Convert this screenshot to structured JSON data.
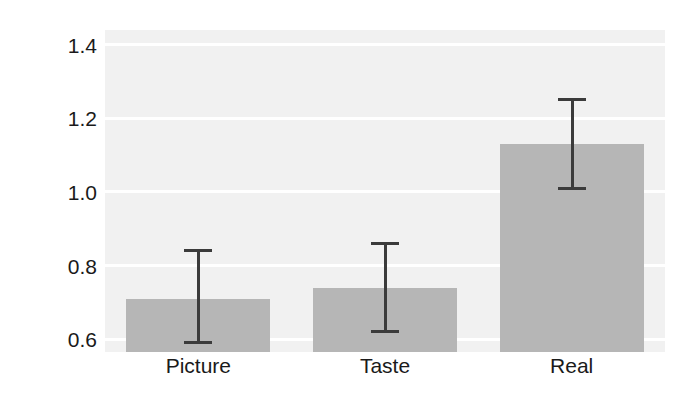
{
  "chart_data": {
    "type": "bar",
    "title": "",
    "xlabel": "",
    "ylabel": "Bid ( $ )",
    "categories": [
      "Picture",
      "Taste",
      "Real"
    ],
    "values": [
      0.71,
      0.74,
      1.13
    ],
    "error_low": [
      0.59,
      0.62,
      1.01
    ],
    "error_high": [
      0.84,
      0.86,
      1.25
    ],
    "ylim": [
      0.565,
      1.44
    ],
    "yticks": [
      0.6,
      0.8,
      1.0,
      1.2,
      1.4
    ],
    "ytick_labels": [
      "0.6",
      "0.8",
      "1.0",
      "1.2",
      "1.4"
    ],
    "grid": true,
    "legend": "none",
    "bar_color": "#b6b6b6",
    "plot_background": "#f1f1f1",
    "gridline_color": "#ffffff",
    "error_color": "#3b3b3b"
  }
}
